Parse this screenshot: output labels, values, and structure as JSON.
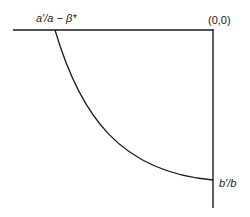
{
  "diagram": {
    "type": "frontier-curve",
    "labels": {
      "top_left": "a′/a − β*",
      "origin": "(0,0)",
      "bottom_right": "b′/b"
    },
    "axes": {
      "horizontal": {
        "x1": 13,
        "y1": 30,
        "x2": 213,
        "y2": 30
      },
      "vertical": {
        "x1": 213,
        "y1": 30,
        "x2": 213,
        "y2": 208
      }
    },
    "curve": {
      "start": {
        "x": 55,
        "y": 30
      },
      "control1": {
        "x": 80,
        "y": 115
      },
      "control2": {
        "x": 120,
        "y": 172
      },
      "end": {
        "x": 213,
        "y": 180
      }
    },
    "colors": {
      "line": "#1a1a1a",
      "background": "#ffffff"
    }
  }
}
